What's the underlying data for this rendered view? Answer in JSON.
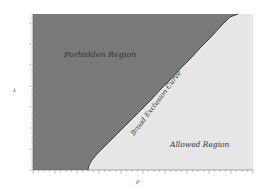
{
  "chart_data": {
    "type": "area",
    "title": "",
    "xlabel": "P",
    "ylabel": "λ",
    "grid": false,
    "legend": null,
    "regions": [
      {
        "name": "Forbidden Region",
        "color": "#7a7a7a",
        "side": "upper-left"
      },
      {
        "name": "Allowed Region",
        "color": "#e6e6e6",
        "side": "lower-right"
      }
    ],
    "curve": {
      "name": "Broad Exclusion Curve",
      "color": "#222222",
      "points_px": [
        [
          88,
          170
        ],
        [
          89,
          165
        ],
        [
          92,
          160
        ],
        [
          97,
          154
        ],
        [
          104,
          147
        ],
        [
          112,
          139
        ],
        [
          121,
          130
        ],
        [
          131,
          120
        ],
        [
          141,
          110
        ],
        [
          151,
          100
        ],
        [
          161,
          89
        ],
        [
          171,
          79
        ],
        [
          181,
          68
        ],
        [
          191,
          58
        ],
        [
          201,
          47
        ],
        [
          211,
          37
        ],
        [
          221,
          26
        ],
        [
          230,
          17
        ],
        [
          238,
          14
        ]
      ]
    },
    "x_ticks": [
      "",
      "",
      "",
      "",
      "",
      "",
      "",
      "",
      "",
      "",
      ""
    ],
    "y_ticks": [
      "",
      "",
      "",
      "",
      "",
      "",
      "",
      ""
    ],
    "annotations": [
      "Forbidden Region",
      "Allowed Region",
      "Broad Exclusion Curve"
    ]
  },
  "labels": {
    "forbidden": "Forbidden Region",
    "allowed": "Allowed Region",
    "curve": "Broad Exclusion Curve",
    "xlabel": "P",
    "ylabel": "λ"
  }
}
